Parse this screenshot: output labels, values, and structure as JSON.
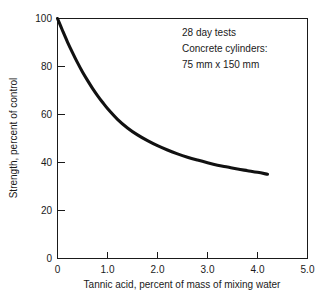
{
  "chart_data": {
    "type": "line",
    "title": "",
    "xlabel": "Tannic acid, percent of mass of mixing water",
    "ylabel": "Strength, percent of control",
    "xlim": [
      0,
      5.0
    ],
    "ylim": [
      0,
      100
    ],
    "grid": false,
    "legend": "none",
    "xticks": [
      "0",
      "1.0",
      "2.0",
      "3.0",
      "4.0",
      "5.0"
    ],
    "xtick_values": [
      0,
      1.0,
      2.0,
      3.0,
      4.0,
      5.0
    ],
    "yticks": [
      "0",
      "20",
      "40",
      "60",
      "80",
      "100"
    ],
    "ytick_values": [
      0,
      20,
      40,
      60,
      80,
      100
    ],
    "series": [
      {
        "name": "Strength vs tannic acid",
        "color": "#111111",
        "x": [
          0.0,
          0.1,
          0.2,
          0.3,
          0.4,
          0.5,
          0.6,
          0.7,
          0.8,
          0.9,
          1.0,
          1.2,
          1.4,
          1.6,
          1.8,
          2.0,
          2.2,
          2.4,
          2.6,
          2.8,
          3.0,
          3.2,
          3.4,
          3.6,
          3.8,
          4.0,
          4.2
        ],
        "y": [
          100.0,
          95.0,
          90.2,
          85.8,
          81.6,
          77.7,
          74.2,
          70.9,
          67.9,
          65.1,
          62.5,
          58.0,
          54.4,
          51.5,
          49.1,
          47.0,
          45.2,
          43.6,
          42.2,
          41.0,
          39.9,
          38.9,
          38.1,
          37.3,
          36.6,
          35.9,
          35.1
        ]
      }
    ],
    "annotations": {
      "lines": [
        "28 day tests",
        "Concrete cylinders:",
        "75 mm x 150 mm"
      ],
      "position": "top-right-inside"
    }
  }
}
